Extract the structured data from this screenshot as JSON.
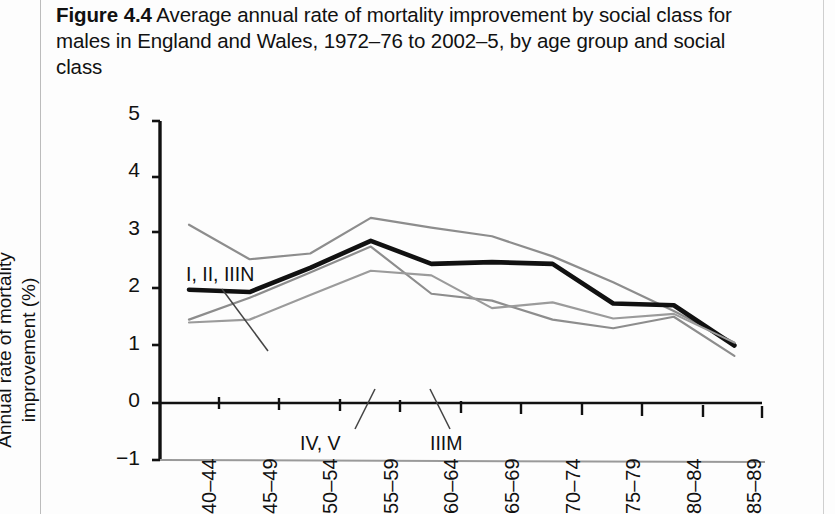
{
  "caption": {
    "figure_label": "Figure 4.4",
    "text": "Average annual rate of mortality improvement by social class for males in England and Wales, 1972–76 to 2002–5, by age group and social class"
  },
  "chart_data": {
    "type": "line",
    "title": "Average annual rate of mortality improvement by social class for males in England and Wales, 1972–76 to 2002–5, by age group and social class",
    "xlabel": "",
    "ylabel": "Annual rate of mortality improvement (%)",
    "categories": [
      "40–44",
      "45–49",
      "50–54",
      "55–59",
      "60–64",
      "65–69",
      "70–74",
      "75–79",
      "80–84",
      "85–89"
    ],
    "ylim": [
      -1,
      5
    ],
    "yticks": [
      5,
      4,
      3,
      2,
      1,
      0,
      -1
    ],
    "grid": false,
    "legend": "inline-annotations",
    "series": [
      {
        "name": "I, II, IIIN",
        "color": "#8d8d8d",
        "width": 2.2,
        "values": [
          3.1,
          2.5,
          2.6,
          3.22,
          3.05,
          2.9,
          2.55,
          2.1,
          1.6,
          1.05
        ]
      },
      {
        "name": "All classes",
        "color": "#111111",
        "width": 4.6,
        "values": [
          1.97,
          1.93,
          2.35,
          2.82,
          2.42,
          2.45,
          2.42,
          1.73,
          1.7,
          1.0
        ]
      },
      {
        "name": "IIIM",
        "color": "#8d8d8d",
        "width": 2.2,
        "values": [
          1.45,
          1.83,
          2.27,
          2.72,
          1.9,
          1.78,
          1.45,
          1.3,
          1.5,
          0.82
        ]
      },
      {
        "name": "IV, V",
        "color": "#9b9b9b",
        "width": 2.2,
        "values": [
          1.4,
          1.45,
          1.88,
          2.3,
          2.22,
          1.65,
          1.75,
          1.47,
          1.55,
          1.05
        ]
      }
    ],
    "annotations": [
      {
        "label": "I, II, IIIN",
        "x": 186,
        "y": 167,
        "leader": [
          222,
          193,
          268,
          255
        ]
      },
      {
        "label": "IV, V",
        "x": 300,
        "y": 336,
        "leader": [
          355,
          333,
          375,
          293
        ]
      },
      {
        "label": "IIIM",
        "x": 430,
        "y": 336,
        "leader": [
          450,
          333,
          430,
          293
        ]
      }
    ]
  }
}
